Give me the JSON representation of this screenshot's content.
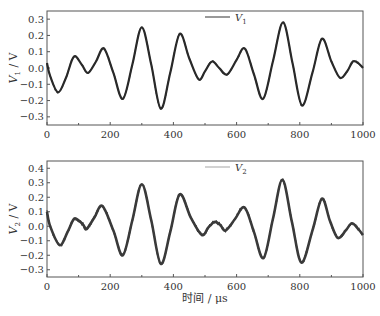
{
  "figure": {
    "x_axis_title": "时间 / μs",
    "x_ticks": [
      0,
      200,
      400,
      600,
      800,
      1000
    ],
    "x_minor_ticks": [
      100,
      300,
      500,
      700,
      900
    ]
  },
  "chart_data": [
    {
      "type": "line",
      "title": "",
      "xlabel": "",
      "ylabel": "V1 / V",
      "ylabel_main": "V",
      "ylabel_sub": "1",
      "ylabel_unit": " / V",
      "xlim": [
        0,
        1000
      ],
      "ylim": [
        -0.35,
        0.35
      ],
      "y_ticks": [
        -0.3,
        -0.2,
        -0.1,
        0.0,
        0.1,
        0.2,
        0.3
      ],
      "y_tick_labels": [
        "−0.3",
        "−0.2",
        "−0.1",
        "0.0",
        "0.1",
        "0.2",
        "0.3"
      ],
      "grid": false,
      "legend_position": "upper center",
      "series": [
        {
          "name": "V1",
          "legend_main": "V",
          "legend_sub": "1",
          "color": "#2a2a2a",
          "legend_color": "#555555",
          "x": [
            0,
            10,
            35,
            60,
            85,
            110,
            130,
            155,
            180,
            210,
            240,
            270,
            300,
            330,
            360,
            390,
            420,
            450,
            480,
            500,
            522,
            545,
            570,
            600,
            626,
            655,
            684,
            715,
            747,
            777,
            807,
            840,
            870,
            900,
            927,
            950,
            968,
            985,
            1000
          ],
          "y": [
            0.03,
            -0.05,
            -0.15,
            -0.06,
            0.07,
            0.02,
            -0.03,
            0.04,
            0.12,
            -0.03,
            -0.19,
            0.02,
            0.25,
            0.02,
            -0.25,
            -0.03,
            0.21,
            0.06,
            -0.07,
            -0.02,
            0.04,
            0.0,
            -0.04,
            0.05,
            0.12,
            -0.04,
            -0.19,
            0.04,
            0.28,
            0.03,
            -0.23,
            -0.03,
            0.18,
            0.04,
            -0.06,
            -0.02,
            0.04,
            0.03,
            0.0
          ]
        }
      ]
    },
    {
      "type": "line",
      "title": "",
      "xlabel": "时间 / μs",
      "ylabel": "V2 / V",
      "ylabel_main": "V",
      "ylabel_sub": "2",
      "ylabel_unit": " / V",
      "xlim": [
        0,
        1000
      ],
      "ylim": [
        -0.35,
        0.45
      ],
      "y_ticks": [
        -0.3,
        -0.2,
        -0.1,
        0.0,
        0.1,
        0.2,
        0.3,
        0.4
      ],
      "y_tick_labels": [
        "−0.3",
        "−0.2",
        "−0.1",
        "0.0",
        "0.1",
        "0.2",
        "0.3",
        "0.4"
      ],
      "grid": false,
      "legend_position": "upper center",
      "series": [
        {
          "name": "V2",
          "legend_main": "V",
          "legend_sub": "2",
          "color": "#3a3a3a",
          "legend_color": "#b5b5b5",
          "x": [
            0,
            10,
            40,
            65,
            85,
            100,
            115,
            125,
            150,
            175,
            210,
            240,
            270,
            300,
            330,
            360,
            390,
            420,
            455,
            490,
            510,
            530,
            548,
            565,
            595,
            625,
            655,
            685,
            715,
            745,
            775,
            805,
            840,
            870,
            895,
            920,
            945,
            965,
            985,
            1000
          ],
          "y": [
            0.1,
            0.0,
            -0.13,
            -0.04,
            0.05,
            0.04,
            0.01,
            -0.02,
            0.06,
            0.14,
            -0.03,
            -0.2,
            0.04,
            0.29,
            0.04,
            -0.26,
            -0.04,
            0.22,
            0.06,
            -0.06,
            -0.01,
            0.03,
            0.01,
            -0.03,
            0.05,
            0.13,
            -0.04,
            -0.22,
            0.05,
            0.32,
            0.03,
            -0.25,
            -0.03,
            0.19,
            0.04,
            -0.08,
            -0.03,
            0.02,
            -0.02,
            -0.06
          ]
        }
      ]
    }
  ]
}
